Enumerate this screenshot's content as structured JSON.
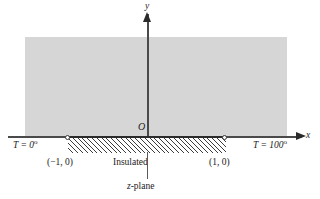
{
  "figure": {
    "colors": {
      "region_fill": "#d6d6d6",
      "axis": "#4a4a4a",
      "hatch": "#3d3d3d",
      "text": "#1a1a1a",
      "background": "#ffffff"
    }
  },
  "axes": {
    "x_label": "x",
    "y_label": "y",
    "origin_label": "O"
  },
  "boundary": {
    "left_condition": "T = 0",
    "left_degree": "o",
    "right_condition": "T = 100",
    "right_degree": "o",
    "middle_condition": "Insulated"
  },
  "points": [
    {
      "name": "point-minus-one",
      "label": "(−1, 0)"
    },
    {
      "name": "point-plus-one",
      "label": "(1, 0)"
    }
  ],
  "annotations": {
    "plane_label_italic": "z",
    "plane_label_rest": "-plane"
  }
}
